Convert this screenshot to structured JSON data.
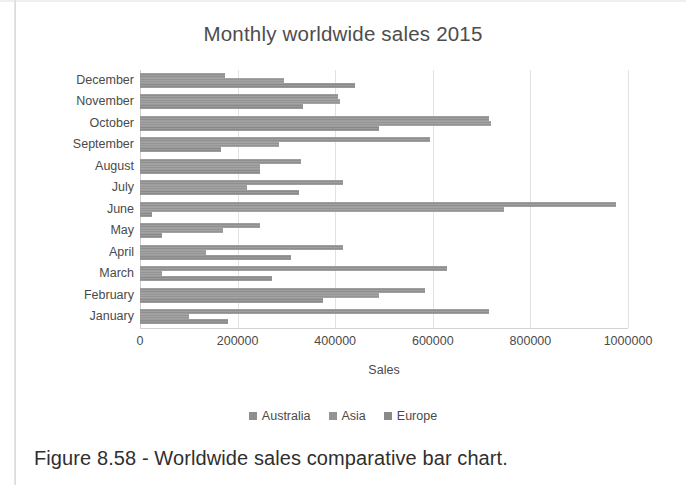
{
  "caption": "Figure 8.58 - Worldwide sales comparative bar chart.",
  "legend": {
    "position": "bottom",
    "entries": [
      "Australia",
      "Asia",
      "Europe"
    ]
  },
  "chart_data": {
    "type": "bar",
    "orientation": "horizontal",
    "title": "Monthly worldwide sales 2015",
    "xlabel": "Sales",
    "ylabel": "",
    "xlim": [
      0,
      1000000
    ],
    "xticks": [
      0,
      200000,
      400000,
      600000,
      800000,
      1000000
    ],
    "xtick_labels": [
      "0",
      "200000",
      "400000",
      "600000",
      "800000",
      "1000000"
    ],
    "grid": true,
    "grid_axis": "x",
    "categories": [
      "December",
      "November",
      "October",
      "September",
      "August",
      "July",
      "June",
      "May",
      "April",
      "March",
      "February",
      "January"
    ],
    "series": [
      {
        "name": "Australia",
        "color": "#8f8f8f",
        "values": [
          175000,
          405000,
          715000,
          595000,
          330000,
          415000,
          975000,
          245000,
          415000,
          630000,
          585000,
          715000
        ]
      },
      {
        "name": "Asia",
        "color": "#949494",
        "values": [
          295000,
          410000,
          720000,
          285000,
          245000,
          220000,
          745000,
          170000,
          135000,
          45000,
          490000,
          100000
        ]
      },
      {
        "name": "Europe",
        "color": "#8a8a8a",
        "values": [
          440000,
          335000,
          490000,
          165000,
          245000,
          325000,
          25000,
          45000,
          310000,
          270000,
          375000,
          180000
        ]
      }
    ]
  }
}
